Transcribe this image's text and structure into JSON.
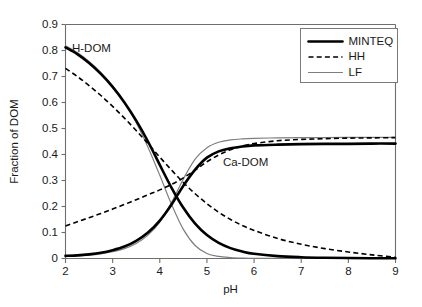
{
  "chart_data": {
    "type": "line",
    "title": "",
    "xlabel": "pH",
    "ylabel": "Fraction of DOM",
    "xlim": [
      2,
      9
    ],
    "ylim": [
      0,
      0.9
    ],
    "xticks": [
      "2",
      "3",
      "4",
      "5",
      "6",
      "7",
      "8",
      "9"
    ],
    "yticks": [
      "0",
      "0.1",
      "0.2",
      "0.3",
      "0.4",
      "0.5",
      "0.6",
      "0.7",
      "0.8",
      "0.9"
    ],
    "grid": false,
    "legend_position": "top-right",
    "legend": [
      {
        "label": "MINTEQ",
        "style": "solid-thick",
        "color": "#000000"
      },
      {
        "label": "HH",
        "style": "dotted",
        "color": "#000000"
      },
      {
        "label": "LF",
        "style": "solid-thin",
        "color": "#7d7d7d"
      }
    ],
    "annotations": [
      {
        "text": "H-DOM",
        "x": 2.55,
        "y": 0.795
      },
      {
        "text": "Ca-DOM",
        "x": 5.82,
        "y": 0.355
      }
    ],
    "x": [
      2.0,
      2.25,
      2.5,
      2.75,
      3.0,
      3.25,
      3.5,
      3.75,
      4.0,
      4.25,
      4.5,
      4.75,
      5.0,
      5.25,
      5.5,
      5.75,
      6.0,
      6.5,
      7.0,
      7.5,
      8.0,
      8.5,
      9.0
    ],
    "series": [
      {
        "name": "MINTEQ",
        "group": "H-DOM",
        "style": "solid-thick",
        "color": "#000000",
        "values": [
          0.812,
          0.786,
          0.752,
          0.71,
          0.66,
          0.6,
          0.53,
          0.45,
          0.36,
          0.272,
          0.195,
          0.134,
          0.09,
          0.06,
          0.04,
          0.027,
          0.018,
          0.009,
          0.005,
          0.003,
          0.002,
          0.001,
          0.001
        ]
      },
      {
        "name": "HH",
        "group": "H-DOM",
        "style": "dotted",
        "color": "#000000",
        "values": [
          0.731,
          0.7,
          0.665,
          0.627,
          0.585,
          0.54,
          0.492,
          0.442,
          0.39,
          0.34,
          0.292,
          0.249,
          0.211,
          0.178,
          0.15,
          0.127,
          0.108,
          0.077,
          0.055,
          0.038,
          0.025,
          0.014,
          0.005
        ]
      },
      {
        "name": "LF",
        "group": "H-DOM",
        "style": "solid-thin",
        "color": "#7d7d7d",
        "values": [
          0.818,
          0.792,
          0.758,
          0.716,
          0.664,
          0.6,
          0.522,
          0.428,
          0.32,
          0.208,
          0.112,
          0.05,
          0.019,
          0.008,
          0.004,
          0.002,
          0.001,
          0.001,
          0.0,
          0.0,
          0.0,
          0.0,
          0.0
        ]
      },
      {
        "name": "MINTEQ",
        "group": "Ca-DOM",
        "style": "solid-thick",
        "color": "#000000",
        "values": [
          0.01,
          0.012,
          0.016,
          0.022,
          0.032,
          0.046,
          0.068,
          0.1,
          0.146,
          0.208,
          0.28,
          0.342,
          0.388,
          0.412,
          0.424,
          0.431,
          0.435,
          0.438,
          0.44,
          0.441,
          0.441,
          0.442,
          0.442
        ]
      },
      {
        "name": "HH",
        "group": "Ca-DOM",
        "style": "dotted",
        "color": "#000000",
        "values": [
          0.125,
          0.141,
          0.157,
          0.173,
          0.19,
          0.208,
          0.226,
          0.245,
          0.264,
          0.285,
          0.31,
          0.34,
          0.372,
          0.398,
          0.418,
          0.432,
          0.442,
          0.453,
          0.458,
          0.461,
          0.463,
          0.464,
          0.465
        ]
      },
      {
        "name": "LF",
        "group": "Ca-DOM",
        "style": "solid-thin",
        "color": "#7d7d7d",
        "values": [
          0.008,
          0.01,
          0.013,
          0.018,
          0.026,
          0.038,
          0.058,
          0.09,
          0.14,
          0.216,
          0.306,
          0.382,
          0.426,
          0.447,
          0.456,
          0.46,
          0.462,
          0.464,
          0.465,
          0.465,
          0.466,
          0.466,
          0.466
        ]
      }
    ]
  }
}
